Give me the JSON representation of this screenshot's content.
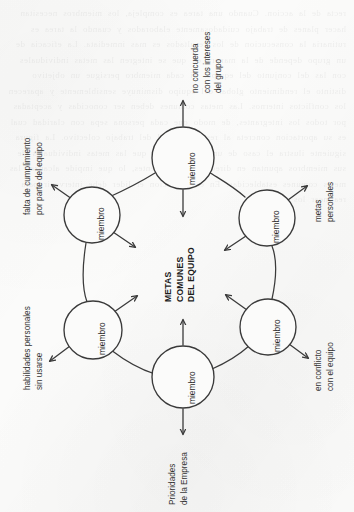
{
  "figure": {
    "orientation": "rotated-90-ccw",
    "center": {
      "lines": [
        "METAS",
        "COMUNES",
        "DEL EQUIPO"
      ],
      "text": "METAS COMUNES DEL EQUIPO"
    },
    "node_label": "miembro",
    "nodes": [
      {
        "id": "top",
        "label": "miembro",
        "cx": 183,
        "cy": 158,
        "r": 31
      },
      {
        "id": "upper-left",
        "label": "miembro",
        "cx": 92,
        "cy": 215,
        "r": 28
      },
      {
        "id": "lower-left",
        "label": "miembro",
        "cx": 93,
        "cy": 330,
        "r": 29
      },
      {
        "id": "bottom",
        "label": "miembro",
        "cx": 183,
        "cy": 377,
        "r": 31
      },
      {
        "id": "lower-right",
        "label": "miembro",
        "cx": 268,
        "cy": 327,
        "r": 28
      },
      {
        "id": "upper-right",
        "label": "miembro",
        "cx": 267,
        "cy": 218,
        "r": 28
      }
    ],
    "outward_labels": [
      {
        "id": "no-concuerda",
        "lines": [
          "no concuerda",
          "con los intereses",
          "del grupo"
        ]
      },
      {
        "id": "falta-cumplimiento",
        "lines": [
          "falta de cumplimiento",
          "por parte del equipo"
        ]
      },
      {
        "id": "habilidades-sin-usar",
        "lines": [
          "habilidades personales",
          "sin usarse"
        ]
      },
      {
        "id": "prioridades-empresa",
        "lines": [
          "Prioridades",
          "de la Empresa"
        ]
      },
      {
        "id": "en-conflicto",
        "lines": [
          "en conflicto",
          "con el equipo"
        ]
      },
      {
        "id": "metas-personales",
        "lines": [
          "metas",
          "personales"
        ]
      }
    ],
    "colors": {
      "paper": "#fbfbfa",
      "ink": "#2e2e2e",
      "stroke": "#3a3a3a"
    }
  },
  "bleed_through": {
    "text": "recta de la accion. Cuando una tarea es compleja, los miembros necesitan hacer planes de trabajo cuidadosamente elaborados y cuando la tarea es rutinaria la consecucion de los resultados es mas inmediata. La eficacia de un grupo depende de la manera en que se integren las metas individuales con las del conjunto del equipo. Si cada miembro persigue un objetivo distinto el rendimiento global del equipo disminuye sensiblemente y aparecen los conflictos internos. Las metas comunes deben ser conocidas y aceptadas por todos los integrantes, de modo que cada persona sepa con claridad cual es su aportacion concreta al resultado final del trabajo colectivo. La figura siguiente ilustra el caso de un equipo en el que las metas individuales de sus miembros apuntan en direcciones divergentes, lo que impide alcanzar las metas comunes establecidas. En esa situacion el lider debe intervenir para realinear los esfuerzos."
  }
}
